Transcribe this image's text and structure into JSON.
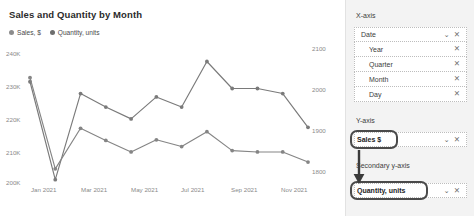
{
  "chart_data": {
    "type": "line",
    "title": "Sales and Quantity by Month",
    "xlabel": "",
    "ylabel": "Sales, $",
    "y2label": "Quantity, units",
    "grid": false,
    "legend_position": "top-left",
    "x": [
      "Jan 2021",
      "Feb 2021",
      "Mar 2021",
      "Apr 2021",
      "May 2021",
      "Jun 2021",
      "Jul 2021",
      "Aug 2021",
      "Sep 2021",
      "Oct 2021",
      "Nov 2021",
      "Dec 2021"
    ],
    "xticks": [
      "Jan 2021",
      "Mar 2021",
      "May 2021",
      "Jul 2021",
      "Sep 2021",
      "Nov 2021"
    ],
    "yticks_left": [
      "240K",
      "230K",
      "220K",
      "210K",
      "200K"
    ],
    "yticks_right": [
      "2100",
      "2000",
      "1900",
      "1800"
    ],
    "ylim": [
      200000,
      240000
    ],
    "y2lim": [
      1750,
      2150
    ],
    "series": [
      {
        "name": "Sales, $",
        "axis": "left",
        "color": "#7a7a7a",
        "values": [
          230000,
          201000,
          226500,
          222500,
          219000,
          225500,
          222500,
          236000,
          228000,
          228000,
          226500,
          216500
        ]
      },
      {
        "name": "Quantity, units",
        "axis": "right",
        "color": "#858585",
        "values": [
          2062,
          1792,
          1912,
          1876,
          1842,
          1878,
          1858,
          1902,
          1846,
          1842,
          1842,
          1812
        ]
      }
    ]
  },
  "legend": {
    "items": [
      {
        "label": "Sales, $",
        "color": "#8c8c8c"
      },
      {
        "label": "Quantity, units",
        "color": "#6e6e6e"
      }
    ]
  },
  "config_panel": {
    "x_axis": {
      "label": "X-axis",
      "primary": {
        "text": "Date",
        "chevron": "chevron-down-icon",
        "close": "close-icon"
      },
      "children": [
        {
          "text": "Year",
          "close": "close-icon"
        },
        {
          "text": "Quarter",
          "close": "close-icon"
        },
        {
          "text": "Month",
          "close": "close-icon"
        },
        {
          "text": "Day",
          "close": "close-icon"
        }
      ]
    },
    "y_axis": {
      "label": "Y-axis",
      "field": {
        "text": "Sales $",
        "chevron": "chevron-down-icon",
        "close": "close-icon",
        "highlighted": true
      }
    },
    "secondary_y_axis": {
      "label": "Secondary y-axis",
      "field": {
        "text": "Quantity, units",
        "chevron": "chevron-down-icon",
        "close": "close-icon",
        "highlighted": true
      }
    },
    "annotation": {
      "type": "arrow",
      "from": "Sales $",
      "to": "Quantity, units",
      "color": "#3a3a3a"
    }
  },
  "icons": {
    "chevron": "⌄",
    "close": "✕"
  }
}
